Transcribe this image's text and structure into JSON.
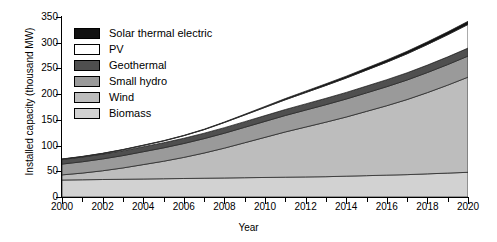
{
  "chart_data": {
    "type": "area",
    "stacked": true,
    "title": "",
    "xlabel": "Year",
    "ylabel": "Installed capacity (thousand MW)",
    "xlim": [
      2000,
      2020
    ],
    "ylim": [
      0,
      350
    ],
    "grid": false,
    "legend_position": "upper-left",
    "x": [
      2000,
      2001,
      2002,
      2003,
      2004,
      2005,
      2006,
      2007,
      2008,
      2009,
      2010,
      2011,
      2012,
      2013,
      2014,
      2015,
      2016,
      2017,
      2018,
      2019,
      2020
    ],
    "xticks": [
      "2000",
      "2002",
      "2004",
      "2006",
      "2008",
      "2010",
      "2012",
      "2014",
      "2016",
      "2018",
      "2020"
    ],
    "xtick_values": [
      2000,
      2002,
      2004,
      2006,
      2008,
      2010,
      2012,
      2014,
      2016,
      2018,
      2020
    ],
    "yticks": [
      "0",
      "50",
      "100",
      "150",
      "200",
      "250",
      "300",
      "350"
    ],
    "ytick_values": [
      0,
      50,
      100,
      150,
      200,
      250,
      300,
      350
    ],
    "series": [
      {
        "name": "Biomass",
        "color": "#d2d2d2",
        "values": [
          33,
          33.5,
          34,
          34.5,
          35,
          35.5,
          36,
          36.5,
          37,
          37.5,
          38,
          38.5,
          39,
          39.5,
          40.5,
          41.5,
          42.5,
          43.5,
          45,
          46.5,
          48
        ]
      },
      {
        "name": "Wind",
        "color": "#bdbdbd",
        "values": [
          10,
          13,
          17,
          22,
          28,
          34,
          41,
          49,
          58,
          68,
          78,
          88,
          97,
          106,
          115,
          125,
          135,
          146,
          158,
          171,
          185
        ]
      },
      {
        "name": "Small hydro",
        "color": "#9a9a9a",
        "values": [
          21,
          22,
          23,
          24,
          25,
          26,
          27,
          28,
          29,
          30,
          31,
          32,
          33,
          34,
          35,
          36,
          37,
          38,
          39,
          40,
          41
        ]
      },
      {
        "name": "Geothermal",
        "color": "#4f4f4f",
        "values": [
          9,
          9.2,
          9.4,
          9.6,
          9.8,
          10,
          10.2,
          10.5,
          10.8,
          11,
          11.3,
          11.6,
          12,
          12.4,
          12.8,
          13.2,
          13.6,
          14,
          14.5,
          15,
          15.5
        ]
      },
      {
        "name": "PV",
        "color": "#ffffff",
        "values": [
          0.5,
          0.8,
          1.2,
          1.8,
          2.5,
          3.5,
          5,
          7,
          10,
          13,
          16,
          19,
          22,
          25,
          28,
          31,
          34,
          37,
          40,
          43,
          46
        ]
      },
      {
        "name": "Solar thermal electric",
        "color": "#111111",
        "values": [
          0.4,
          0.4,
          0.4,
          0.4,
          0.5,
          0.5,
          0.6,
          0.8,
          1,
          1.3,
          1.8,
          2.3,
          2.8,
          3.2,
          3.6,
          4,
          4.4,
          4.8,
          5.2,
          5.6,
          6
        ]
      }
    ],
    "totals": [
      73.9,
      78.9,
      85,
      92.3,
      100.8,
      109.5,
      119.8,
      131.8,
      145.8,
      160.8,
      176.1,
      191.4,
      205.8,
      220.1,
      234.9,
      250.7,
      266.5,
      283.3,
      301.7,
      321.1,
      341.5
    ]
  },
  "legend": {
    "items": [
      {
        "label": "Solar thermal electric",
        "color": "#111111"
      },
      {
        "label": "PV",
        "color": "#ffffff"
      },
      {
        "label": "Geothermal",
        "color": "#4f4f4f"
      },
      {
        "label": "Small hydro",
        "color": "#9a9a9a"
      },
      {
        "label": "Wind",
        "color": "#bdbdbd"
      },
      {
        "label": "Biomass",
        "color": "#d2d2d2"
      }
    ]
  }
}
